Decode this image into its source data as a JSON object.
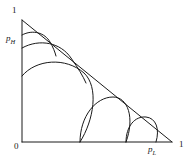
{
  "figure": {
    "type": "line-diagram",
    "axes": {
      "vertical": {
        "variable_label": "p",
        "variable_subscript": "H",
        "origin_tick": "0",
        "max_tick": "1"
      },
      "horizontal": {
        "variable_label": "p",
        "variable_subscript": "L",
        "origin_tick": "0",
        "max_tick": "1"
      }
    },
    "labels": {
      "top_one": "1",
      "origin_zero": "0",
      "right_one": "1"
    },
    "colors": {
      "background": "#ffffff",
      "stroke": "#1a1a1a",
      "text": "#1a1a1a"
    },
    "geometry": {
      "apex": [
        22,
        20
      ],
      "origin": [
        22,
        142
      ],
      "right_vertex": [
        172,
        142
      ],
      "stroke_width": 1
    },
    "curves": [
      {
        "name": "curve-1",
        "start": [
          22,
          35
        ],
        "tangent": [
          46,
          32
        ],
        "end": [
          56,
          56
        ],
        "note": "smallest arc near apex, from vertical axis to hypotenuse"
      },
      {
        "name": "curve-2",
        "start": [
          22,
          48
        ],
        "tangent": [
          64,
          47
        ],
        "end": [
          86,
          83
        ],
        "note": "second arc from vertical axis to hypotenuse"
      },
      {
        "name": "curve-3",
        "start": [
          22,
          76
        ],
        "tangent": [
          96,
          72
        ],
        "end": [
          80,
          142
        ],
        "note": "largest arc from vertical axis down to horizontal axis"
      },
      {
        "name": "curve-4",
        "start": [
          80,
          142
        ],
        "tangent": [
          128,
          103
        ],
        "end": [
          126,
          142
        ],
        "note": "arc from horizontal axis to hypotenuse"
      },
      {
        "name": "curve-5",
        "start": [
          126,
          142
        ],
        "tangent": [
          152,
          120
        ],
        "end": [
          156,
          142
        ],
        "note": "smallest right arc from horizontal axis to hypotenuse"
      }
    ]
  }
}
